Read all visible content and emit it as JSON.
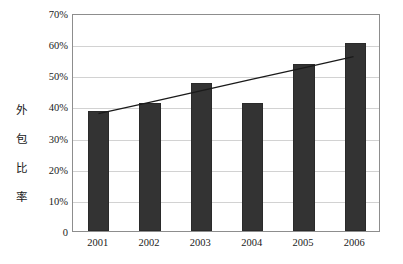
{
  "chart_data": {
    "type": "bar",
    "title": "",
    "subtitle": "",
    "xlabel": "",
    "ylabel": "外包比率",
    "ylabel_chars": [
      "外",
      "包",
      "比",
      "率"
    ],
    "categories": [
      "2001",
      "2002",
      "2003",
      "2004",
      "2005",
      "2006"
    ],
    "values": [
      38.5,
      41.0,
      47.5,
      41.0,
      53.5,
      60.5
    ],
    "series": [
      {
        "name": "外包比率",
        "type": "bar",
        "values": [
          38.5,
          41.0,
          47.5,
          41.0,
          53.5,
          60.5
        ]
      },
      {
        "name": "trendline",
        "type": "line",
        "values": [
          38.0,
          41.7,
          45.4,
          49.1,
          52.8,
          56.5
        ]
      }
    ],
    "ylim": [
      0,
      70
    ],
    "yticks": [
      0,
      10,
      20,
      30,
      40,
      50,
      60,
      70
    ],
    "ytick_labels": [
      "0",
      "10%",
      "20%",
      "30%",
      "40%",
      "50%",
      "60%",
      "70%"
    ],
    "grid": true,
    "grid_axis": "y",
    "legend": false,
    "legend_position": "none",
    "bar_color": "#333333",
    "line_color": "#1a1a1a",
    "grid_color": "#d2d2d2",
    "frame_color": "#8d8d8d",
    "background_color": "#ffffff",
    "annotations": []
  }
}
